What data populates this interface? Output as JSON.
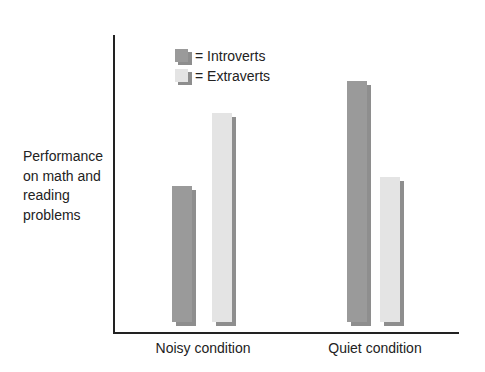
{
  "chart_data": {
    "type": "bar",
    "title": "",
    "xlabel": "",
    "ylabel": "Performance on math and reading problems",
    "ylabel_lines": [
      "Performance",
      "on math and",
      "reading",
      "problems"
    ],
    "categories": [
      "Noisy condition",
      "Quiet condition"
    ],
    "series": [
      {
        "name": "Introverts",
        "color": "#9a9a9a",
        "values": [
          47,
          83
        ]
      },
      {
        "name": "Extraverts",
        "color": "#e4e4e4",
        "values": [
          72,
          50
        ]
      }
    ],
    "ylim": [
      0,
      100
    ],
    "y_ticks": "none (relative scale)",
    "grid": false,
    "legend_position": "top-left inside plot",
    "legend": [
      {
        "label": "= Introverts",
        "color": "#9a9a9a"
      },
      {
        "label": "= Extraverts",
        "color": "#e4e4e4"
      }
    ]
  },
  "colors": {
    "shadow": "#8e8e8e",
    "axis": "#222222"
  }
}
